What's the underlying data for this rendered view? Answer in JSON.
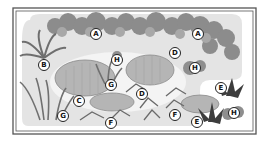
{
  "diagram": {
    "type": "garden-planting-plan",
    "colors": {
      "border": "#555555",
      "bed_fill": "#e6e6e6",
      "rock_fill": "#b8b8b8",
      "foliage_dark": "#7a7a7a",
      "foliage_mid": "#9a9a9a",
      "label_bg": "#ffffff",
      "label_text": "#111111"
    },
    "labels": [
      {
        "text": "A",
        "x": 96,
        "y": 34
      },
      {
        "text": "A",
        "x": 198,
        "y": 34
      },
      {
        "text": "B",
        "x": 44,
        "y": 65
      },
      {
        "text": "D",
        "x": 175,
        "y": 53
      },
      {
        "text": "H",
        "x": 117,
        "y": 60
      },
      {
        "text": "H",
        "x": 195,
        "y": 68
      },
      {
        "text": "G",
        "x": 111,
        "y": 85
      },
      {
        "text": "C",
        "x": 79,
        "y": 101
      },
      {
        "text": "D",
        "x": 142,
        "y": 94
      },
      {
        "text": "E",
        "x": 221,
        "y": 88
      },
      {
        "text": "G",
        "x": 63,
        "y": 116
      },
      {
        "text": "F",
        "x": 111,
        "y": 123
      },
      {
        "text": "F",
        "x": 175,
        "y": 115
      },
      {
        "text": "E",
        "x": 197,
        "y": 122
      },
      {
        "text": "H",
        "x": 234,
        "y": 113
      }
    ]
  }
}
